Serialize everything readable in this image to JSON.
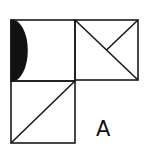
{
  "diagram": {
    "label": "A",
    "stroke_color": "#1a1a1a",
    "fill_color": "#111111",
    "background": "#ffffff",
    "tiles": [
      {
        "position": "top-left",
        "content": "half-disc filled black on left edge"
      },
      {
        "position": "top-right",
        "content": "diagonal top-left to bottom-right plus half diagonal from top-right corner to center"
      },
      {
        "position": "bottom-left",
        "content": "diagonal from bottom-left to top-right"
      }
    ]
  }
}
